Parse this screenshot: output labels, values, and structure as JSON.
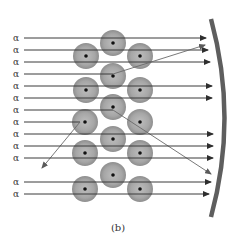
{
  "figure": {
    "caption": "(b)",
    "particle_label": "α",
    "colors": {
      "ray": "#3a3a3a",
      "deflected_ray": "#6a6a6a",
      "atom_outer": "#9a9a9a",
      "atom_inner": "#b8b8b8",
      "nucleus": "#111111",
      "screen": "#5e5e5e",
      "background": "#ffffff"
    },
    "rays": [
      {
        "y": 38,
        "end_x": 206,
        "type": "straight"
      },
      {
        "y": 50,
        "end_x": 208,
        "type": "straight"
      },
      {
        "y": 62,
        "end_x": 210,
        "type": "straight"
      },
      {
        "y": 74,
        "end_x": 113,
        "type": "deflected",
        "to": [
          205,
          45
        ]
      },
      {
        "y": 86,
        "end_x": 212,
        "type": "straight"
      },
      {
        "y": 98,
        "end_x": 212,
        "type": "straight"
      },
      {
        "y": 110,
        "end_x": 113,
        "type": "deflected",
        "to": [
          211,
          174
        ]
      },
      {
        "y": 122,
        "end_x": 80,
        "type": "backscattered",
        "to": [
          42,
          168
        ]
      },
      {
        "y": 134,
        "end_x": 213,
        "type": "straight"
      },
      {
        "y": 146,
        "end_x": 213,
        "type": "straight"
      },
      {
        "y": 158,
        "end_x": 213,
        "type": "straight"
      },
      {
        "y": 182,
        "end_x": 211,
        "type": "straight"
      },
      {
        "y": 194,
        "end_x": 209,
        "type": "straight"
      }
    ],
    "atoms": [
      {
        "cx": 113,
        "cy": 43
      },
      {
        "cx": 86,
        "cy": 56
      },
      {
        "cx": 140,
        "cy": 56
      },
      {
        "cx": 113,
        "cy": 76
      },
      {
        "cx": 86,
        "cy": 90
      },
      {
        "cx": 140,
        "cy": 90
      },
      {
        "cx": 113,
        "cy": 107
      },
      {
        "cx": 85,
        "cy": 122
      },
      {
        "cx": 140,
        "cy": 122
      },
      {
        "cx": 113,
        "cy": 139
      },
      {
        "cx": 85,
        "cy": 153
      },
      {
        "cx": 140,
        "cy": 153
      },
      {
        "cx": 113,
        "cy": 175
      },
      {
        "cx": 85,
        "cy": 189
      },
      {
        "cx": 140,
        "cy": 189
      }
    ],
    "screen": {
      "top": [
        211,
        19
      ],
      "control": [
        238,
        118
      ],
      "bottom": [
        211,
        217
      ]
    }
  }
}
